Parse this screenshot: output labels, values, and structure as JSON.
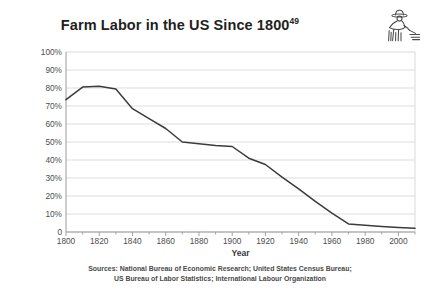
{
  "chart_data": {
    "type": "line",
    "title": "Farm Labor in the US Since 1800",
    "title_superscript": "49",
    "xlabel": "Year",
    "ylabel": "Percentage of workforce in farming",
    "xlim": [
      1800,
      2010
    ],
    "ylim": [
      0,
      100
    ],
    "grid": true,
    "legend": "none",
    "x_tick_labels": [
      "1800",
      "1820",
      "1840",
      "1860",
      "1880",
      "1900",
      "1920",
      "1940",
      "1960",
      "1980",
      "2000"
    ],
    "x_tick_values": [
      1800,
      1820,
      1840,
      1860,
      1880,
      1900,
      1920,
      1940,
      1960,
      1980,
      2000
    ],
    "x_minor_step": 10,
    "y_tick_labels": [
      "0",
      "10%",
      "20%",
      "30%",
      "40%",
      "50%",
      "60%",
      "70%",
      "80%",
      "90%",
      "100%"
    ],
    "y_tick_values": [
      0,
      10,
      20,
      30,
      40,
      50,
      60,
      70,
      80,
      90,
      100
    ],
    "series": [
      {
        "name": "Percentage of workforce in farming",
        "color": "#3b3b3b",
        "x": [
          1800,
          1810,
          1820,
          1830,
          1840,
          1850,
          1860,
          1870,
          1880,
          1890,
          1900,
          1910,
          1920,
          1930,
          1940,
          1950,
          1960,
          1970,
          1980,
          1990,
          2000,
          2010
        ],
        "values": [
          73.5,
          80.5,
          81.0,
          79.5,
          68.5,
          63.0,
          57.5,
          50.0,
          49.0,
          48.0,
          47.5,
          41.0,
          37.5,
          30.5,
          24.0,
          17.0,
          10.5,
          4.5,
          3.7,
          3.0,
          2.5,
          2.1
        ]
      }
    ],
    "sources_lines": [
      "Sources: National Bureau of Economic Research; United States Census Bureau;",
      "US Bureau of Labor Statistics; International Labour Organization"
    ],
    "icon": "farmer-icon"
  },
  "colors": {
    "line": "#3b3b3b",
    "grid": "#d9d9d9",
    "axis": "#9a9a9a",
    "text": "#231f20",
    "tick_text": "#4d4d4d"
  }
}
